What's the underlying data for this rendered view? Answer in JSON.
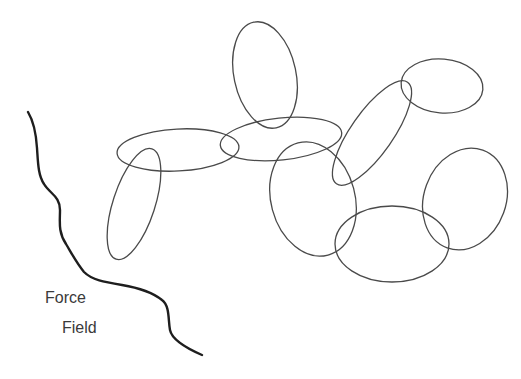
{
  "diagram": {
    "labels": {
      "line1": "Force",
      "line2": "Field"
    },
    "stroke_color": "#4a4a4a",
    "field_line_color": "#1e1e1e",
    "background": "#ffffff",
    "elements": [
      {
        "kind": "ellipse",
        "name": "top-vertical-loop"
      },
      {
        "kind": "ellipse",
        "name": "left-horizontal-loop"
      },
      {
        "kind": "ellipse",
        "name": "left-vertical-loop"
      },
      {
        "kind": "ellipse",
        "name": "middle-horizontal-loop"
      },
      {
        "kind": "ellipse",
        "name": "center-round-loop"
      },
      {
        "kind": "ellipse",
        "name": "diagonal-loop"
      },
      {
        "kind": "ellipse",
        "name": "upper-right-loop"
      },
      {
        "kind": "ellipse",
        "name": "bottom-loop"
      },
      {
        "kind": "ellipse",
        "name": "right-loop"
      },
      {
        "kind": "curve",
        "name": "force-field-boundary"
      }
    ]
  }
}
